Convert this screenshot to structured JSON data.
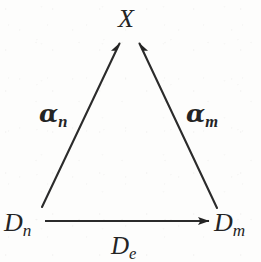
{
  "figure": {
    "background_color": "#fdfdfc",
    "ink_color": "#242424"
  },
  "nodes": [
    {
      "id": "apex",
      "name": "node-x",
      "base": "X",
      "subscript": "",
      "x": 128,
      "y": 22
    },
    {
      "id": "bottom-left",
      "name": "node-dn",
      "base": "D",
      "subscript": "n",
      "x": 23,
      "y": 223
    },
    {
      "id": "bottom-right",
      "name": "node-dm",
      "base": "D",
      "subscript": "m",
      "x": 235,
      "y": 223
    }
  ],
  "edges": [
    {
      "id": "left-diagonal",
      "name": "edge-alpha-n",
      "from": "bottom-left",
      "to": "apex",
      "label_base": "α",
      "label_subscript": "n",
      "arrowhead": "to",
      "x1": 42,
      "y1": 207,
      "x2": 119,
      "y2": 43
    },
    {
      "id": "right-diagonal",
      "name": "edge-alpha-m",
      "from": "bottom-right",
      "to": "apex",
      "label_base": "α",
      "label_subscript": "m",
      "arrowhead": "to",
      "x1": 217,
      "y1": 208,
      "x2": 140,
      "y2": 43
    },
    {
      "id": "base-edge",
      "name": "edge-de",
      "from": "bottom-left",
      "to": "bottom-right",
      "label_base": "D",
      "label_subscript": "e",
      "arrowhead": "to",
      "x1": 45,
      "y1": 221,
      "x2": 209,
      "y2": 221
    }
  ],
  "labels": {
    "apex": {
      "base": "X",
      "subscript": ""
    },
    "bottom_left": {
      "base": "D",
      "subscript": "n"
    },
    "bottom_right": {
      "base": "D",
      "subscript": "m"
    },
    "left_edge": {
      "base": "α",
      "subscript": "n"
    },
    "right_edge": {
      "base": "α",
      "subscript": "m"
    },
    "base_edge": {
      "base": "D",
      "subscript": "e"
    }
  }
}
